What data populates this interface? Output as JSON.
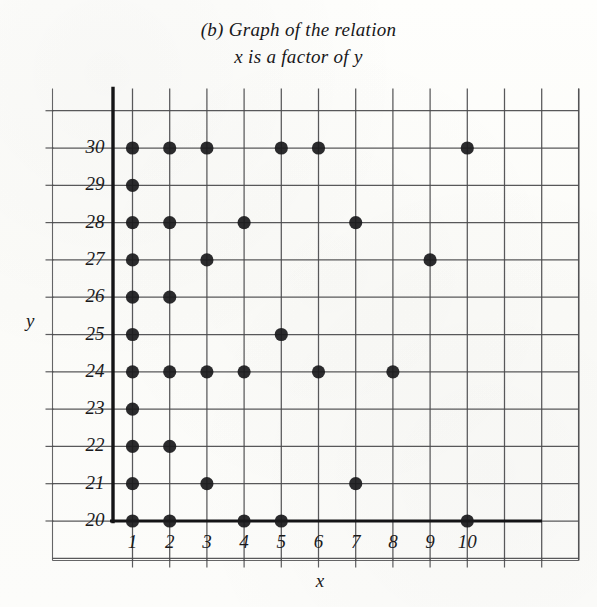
{
  "title": {
    "line1": "(b) Graph of the relation",
    "line2": "x is a factor of y"
  },
  "axes": {
    "x_name": "x",
    "y_name": "y",
    "x_ticks": [
      "1",
      "2",
      "3",
      "4",
      "5",
      "6",
      "7",
      "8",
      "9",
      "10"
    ],
    "y_ticks": [
      "20",
      "21",
      "22",
      "23",
      "24",
      "25",
      "26",
      "27",
      "28",
      "29",
      "30"
    ]
  },
  "style": {
    "background": "#fdfdfb",
    "grid_color": "#4a4a4c",
    "axis_color": "#141416",
    "dot_color": "#1b1b1d",
    "text_color": "#1a1a1c"
  },
  "chart_data": {
    "type": "scatter",
    "title": "(b) Graph of the relation x is a factor of y",
    "xlabel": "x",
    "ylabel": "y",
    "xlim": [
      1,
      10
    ],
    "ylim": [
      20,
      30
    ],
    "grid": true,
    "legend": null,
    "x_ticks": [
      1,
      2,
      3,
      4,
      5,
      6,
      7,
      8,
      9,
      10
    ],
    "y_ticks": [
      20,
      21,
      22,
      23,
      24,
      25,
      26,
      27,
      28,
      29,
      30
    ],
    "relation": "x is a factor of y",
    "points": [
      {
        "x": 1,
        "y": 20
      },
      {
        "x": 2,
        "y": 20
      },
      {
        "x": 4,
        "y": 20
      },
      {
        "x": 5,
        "y": 20
      },
      {
        "x": 10,
        "y": 20
      },
      {
        "x": 1,
        "y": 21
      },
      {
        "x": 3,
        "y": 21
      },
      {
        "x": 7,
        "y": 21
      },
      {
        "x": 1,
        "y": 22
      },
      {
        "x": 2,
        "y": 22
      },
      {
        "x": 1,
        "y": 23
      },
      {
        "x": 1,
        "y": 24
      },
      {
        "x": 2,
        "y": 24
      },
      {
        "x": 3,
        "y": 24
      },
      {
        "x": 4,
        "y": 24
      },
      {
        "x": 6,
        "y": 24
      },
      {
        "x": 8,
        "y": 24
      },
      {
        "x": 1,
        "y": 25
      },
      {
        "x": 5,
        "y": 25
      },
      {
        "x": 1,
        "y": 26
      },
      {
        "x": 2,
        "y": 26
      },
      {
        "x": 1,
        "y": 27
      },
      {
        "x": 3,
        "y": 27
      },
      {
        "x": 9,
        "y": 27
      },
      {
        "x": 1,
        "y": 28
      },
      {
        "x": 2,
        "y": 28
      },
      {
        "x": 4,
        "y": 28
      },
      {
        "x": 7,
        "y": 28
      },
      {
        "x": 1,
        "y": 29
      },
      {
        "x": 1,
        "y": 30
      },
      {
        "x": 2,
        "y": 30
      },
      {
        "x": 3,
        "y": 30
      },
      {
        "x": 5,
        "y": 30
      },
      {
        "x": 6,
        "y": 30
      },
      {
        "x": 10,
        "y": 30
      }
    ]
  }
}
